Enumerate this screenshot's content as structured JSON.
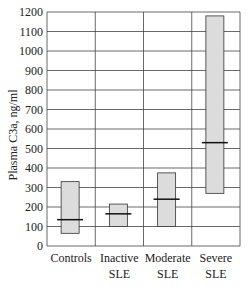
{
  "chart_data": {
    "type": "box",
    "title": "",
    "xlabel": "",
    "ylabel": "Plasma C3a, ng/ml",
    "ylim": [
      0,
      1200
    ],
    "yticks": [
      0,
      100,
      200,
      300,
      400,
      500,
      600,
      700,
      800,
      900,
      1000,
      1100,
      1200
    ],
    "grid": true,
    "categories": [
      {
        "line1": "Controls",
        "line2": ""
      },
      {
        "line1": "Inactive",
        "line2": "SLE"
      },
      {
        "line1": "Moderate",
        "line2": "SLE"
      },
      {
        "line1": "Severe",
        "line2": "SLE"
      }
    ],
    "boxes": [
      {
        "name": "Controls",
        "low": 65,
        "high": 330,
        "median": 135
      },
      {
        "name": "Inactive SLE",
        "low": 100,
        "high": 215,
        "median": 165
      },
      {
        "name": "Moderate SLE",
        "low": 100,
        "high": 375,
        "median": 240
      },
      {
        "name": "Severe SLE",
        "low": 270,
        "high": 1180,
        "median": 530
      }
    ],
    "colors": {
      "box_fill": "#dcdcdc",
      "box_stroke": "#333333",
      "grid": "#444444"
    }
  }
}
